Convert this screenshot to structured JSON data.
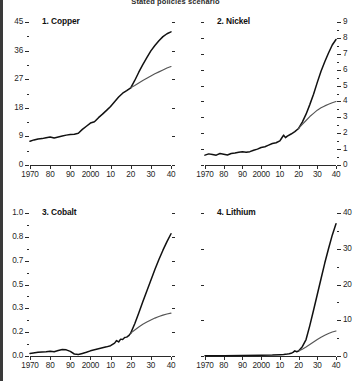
{
  "suptitle": "Stated policies scenario",
  "chart_data": [
    {
      "type": "line",
      "title": "1. Copper",
      "panel": 1,
      "xlabel": "",
      "ylabel": "",
      "xlim": [
        1970,
        2040
      ],
      "ylim": [
        0,
        45
      ],
      "xticks": [
        1970,
        1980,
        1990,
        2000,
        2010,
        2020,
        2030,
        2040
      ],
      "xticklabels": [
        "1970",
        "80",
        "90",
        "2000",
        "10",
        "20",
        "30",
        "40"
      ],
      "yticks": [
        0,
        9,
        18,
        27,
        36,
        45
      ],
      "yticklabels": [
        "0",
        "9",
        "18",
        "27",
        "36",
        "45"
      ],
      "yaxis_side": "left",
      "grid": false,
      "legend": "none",
      "series": [
        {
          "name": "historical",
          "x": [
            1970,
            1972,
            1974,
            1976,
            1978,
            1980,
            1982,
            1984,
            1986,
            1988,
            1990,
            1992,
            1994,
            1996,
            1998,
            2000,
            2002,
            2004,
            2006,
            2008,
            2010,
            2012,
            2014,
            2016,
            2018,
            2020
          ],
          "values": [
            7.5,
            7.9,
            8.2,
            8.3,
            8.6,
            8.8,
            8.5,
            8.8,
            9.1,
            9.4,
            9.6,
            9.7,
            10.0,
            11.2,
            12.2,
            13.2,
            13.6,
            14.9,
            16.0,
            17.2,
            18.4,
            19.9,
            21.4,
            22.6,
            23.4,
            24.3
          ]
        },
        {
          "name": "projection-high",
          "x": [
            2020,
            2022,
            2024,
            2026,
            2028,
            2030,
            2032,
            2034,
            2036,
            2038,
            2040
          ],
          "values": [
            24.3,
            26.6,
            29.2,
            31.6,
            33.8,
            35.9,
            37.6,
            39.1,
            40.4,
            41.3,
            41.9
          ]
        },
        {
          "name": "projection-low",
          "x": [
            2020,
            2022,
            2024,
            2026,
            2028,
            2030,
            2032,
            2034,
            2036,
            2038,
            2040
          ],
          "values": [
            24.3,
            25.0,
            25.8,
            26.6,
            27.3,
            28.0,
            28.7,
            29.3,
            29.9,
            30.5,
            31.0
          ]
        }
      ]
    },
    {
      "type": "line",
      "title": "2. Nickel",
      "panel": 2,
      "xlabel": "",
      "ylabel": "",
      "xlim": [
        1970,
        2040
      ],
      "ylim": [
        0,
        9
      ],
      "xticks": [
        1970,
        1980,
        1990,
        2000,
        2010,
        2020,
        2030,
        2040
      ],
      "xticklabels": [
        "1970",
        "80",
        "90",
        "2000",
        "10",
        "20",
        "30",
        "40"
      ],
      "yticks": [
        0,
        1,
        2,
        3,
        4,
        5,
        6,
        7,
        8,
        9
      ],
      "yticklabels": [
        "0",
        "1",
        "2",
        "3",
        "4",
        "5",
        "6",
        "7",
        "8",
        "9"
      ],
      "yaxis_side": "right",
      "grid": false,
      "legend": "none",
      "series": [
        {
          "name": "historical",
          "x": [
            1970,
            1972,
            1974,
            1976,
            1978,
            1980,
            1982,
            1984,
            1986,
            1988,
            1990,
            1992,
            1994,
            1996,
            1998,
            2000,
            2002,
            2004,
            2006,
            2008,
            2010,
            2011,
            2012,
            2013,
            2014,
            2016,
            2018,
            2020
          ],
          "values": [
            0.62,
            0.7,
            0.66,
            0.62,
            0.72,
            0.68,
            0.63,
            0.72,
            0.75,
            0.8,
            0.83,
            0.8,
            0.84,
            0.93,
            1.0,
            1.1,
            1.15,
            1.25,
            1.35,
            1.4,
            1.52,
            1.7,
            1.88,
            1.72,
            1.82,
            1.95,
            2.1,
            2.3
          ]
        },
        {
          "name": "projection-high",
          "x": [
            2020,
            2022,
            2024,
            2026,
            2028,
            2030,
            2032,
            2034,
            2036,
            2038,
            2040
          ],
          "values": [
            2.3,
            2.7,
            3.2,
            3.8,
            4.45,
            5.2,
            5.9,
            6.5,
            7.05,
            7.55,
            7.9
          ]
        },
        {
          "name": "projection-low",
          "x": [
            2020,
            2022,
            2024,
            2026,
            2028,
            2030,
            2032,
            2034,
            2036,
            2038,
            2040
          ],
          "values": [
            2.3,
            2.55,
            2.8,
            3.05,
            3.25,
            3.45,
            3.6,
            3.72,
            3.82,
            3.92,
            4.0
          ]
        }
      ]
    },
    {
      "type": "line",
      "title": "3. Cobalt",
      "panel": 3,
      "xlabel": "",
      "ylabel": "",
      "xlim": [
        1970,
        2040
      ],
      "ylim": [
        0,
        1.0
      ],
      "xticks": [
        1970,
        1980,
        1990,
        2000,
        2010,
        2020,
        2030,
        2040
      ],
      "xticklabels": [
        "1970",
        "80",
        "90",
        "2000",
        "10",
        "20",
        "30",
        "40"
      ],
      "yticks": [
        0.0,
        0.2,
        0.3,
        0.5,
        0.7,
        0.8,
        1.0
      ],
      "yticklabels": [
        "0.0",
        "0.2",
        "0.3",
        "0.5",
        "0.7",
        "0.8",
        "1.0"
      ],
      "yaxis_side": "left",
      "grid": false,
      "legend": "none",
      "series": [
        {
          "name": "historical",
          "x": [
            1970,
            1974,
            1978,
            1980,
            1982,
            1984,
            1986,
            1988,
            1990,
            1992,
            1994,
            1996,
            1998,
            2000,
            2004,
            2008,
            2010,
            2012,
            2013,
            2014,
            2015,
            2016,
            2017,
            2018,
            2019,
            2020
          ],
          "values": [
            0.018,
            0.026,
            0.03,
            0.033,
            0.03,
            0.038,
            0.045,
            0.043,
            0.032,
            0.014,
            0.01,
            0.018,
            0.026,
            0.036,
            0.05,
            0.064,
            0.072,
            0.09,
            0.108,
            0.098,
            0.118,
            0.116,
            0.13,
            0.132,
            0.142,
            0.16
          ]
        },
        {
          "name": "projection-high",
          "x": [
            2020,
            2022,
            2024,
            2026,
            2028,
            2030,
            2032,
            2034,
            2036,
            2038,
            2040
          ],
          "values": [
            0.16,
            0.225,
            0.3,
            0.38,
            0.455,
            0.53,
            0.605,
            0.675,
            0.74,
            0.8,
            0.855
          ]
        },
        {
          "name": "projection-low",
          "x": [
            2020,
            2022,
            2024,
            2026,
            2028,
            2030,
            2032,
            2034,
            2036,
            2038,
            2040
          ],
          "values": [
            0.16,
            0.182,
            0.203,
            0.222,
            0.238,
            0.252,
            0.265,
            0.276,
            0.286,
            0.294,
            0.3
          ]
        }
      ]
    },
    {
      "type": "line",
      "title": "4. Lithium",
      "panel": 4,
      "xlabel": "",
      "ylabel": "",
      "xlim": [
        1970,
        2040
      ],
      "ylim": [
        0,
        40
      ],
      "xticks": [
        1970,
        1980,
        1990,
        2000,
        2010,
        2020,
        2030,
        2040
      ],
      "xticklabels": [
        "1970",
        "80",
        "90",
        "2000",
        "10",
        "20",
        "30",
        "40"
      ],
      "yticks": [
        0,
        10,
        20,
        30,
        40
      ],
      "yticklabels": [
        "0",
        "10",
        "20",
        "30",
        "40"
      ],
      "yaxis_side": "right",
      "grid": false,
      "legend": "none",
      "series": [
        {
          "name": "historical",
          "x": [
            1970,
            1980,
            1990,
            2000,
            2006,
            2010,
            2012,
            2014,
            2015,
            2016,
            2017,
            2018,
            2019,
            2020
          ],
          "values": [
            0.05,
            0.08,
            0.12,
            0.2,
            0.28,
            0.38,
            0.45,
            0.55,
            0.62,
            0.75,
            1.0,
            1.45,
            1.2,
            1.4
          ]
        },
        {
          "name": "projection-high",
          "x": [
            2020,
            2022,
            2024,
            2026,
            2028,
            2030,
            2032,
            2034,
            2036,
            2038,
            2040
          ],
          "values": [
            1.4,
            2.6,
            4.6,
            8.5,
            12.8,
            17.2,
            21.6,
            26.0,
            30.0,
            33.8,
            37.0
          ]
        },
        {
          "name": "projection-low",
          "x": [
            2020,
            2022,
            2024,
            2026,
            2028,
            2030,
            2032,
            2034,
            2036,
            2038,
            2040
          ],
          "values": [
            1.4,
            1.9,
            2.5,
            3.2,
            3.9,
            4.6,
            5.25,
            5.8,
            6.3,
            6.7,
            7.0
          ]
        }
      ]
    }
  ]
}
